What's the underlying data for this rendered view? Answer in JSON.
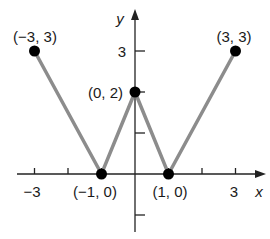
{
  "chart_data": {
    "type": "line",
    "title": "",
    "xlabel": "x",
    "ylabel": "y",
    "x": [
      -3,
      -1,
      0,
      1,
      3
    ],
    "series": [
      {
        "name": "graph",
        "values": [
          3,
          0,
          2,
          0,
          3
        ]
      }
    ],
    "points": [
      {
        "x": -3,
        "y": 3,
        "label": "(−3, 3)"
      },
      {
        "x": -1,
        "y": 0,
        "label": "(−1, 0)"
      },
      {
        "x": 0,
        "y": 2,
        "label": "(0, 2)"
      },
      {
        "x": 1,
        "y": 0,
        "label": "(1, 0)"
      },
      {
        "x": 3,
        "y": 3,
        "label": "(3, 3)"
      }
    ],
    "x_tick_labels": [
      "−3",
      "3"
    ],
    "y_tick_labels": [
      "3"
    ],
    "xlim": [
      -4,
      4
    ],
    "ylim": [
      -1.5,
      4
    ],
    "grid": false,
    "line_color": "#8c8c8c",
    "point_color": "#000000"
  }
}
